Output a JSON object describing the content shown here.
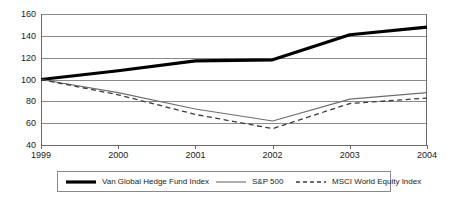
{
  "chart_data": {
    "type": "line",
    "title": "",
    "subtitle": "",
    "xlabel": "",
    "ylabel": "",
    "x": [
      "1999",
      "2000",
      "2001",
      "2002",
      "2003",
      "2004"
    ],
    "categories": [
      "1999",
      "2000",
      "2001",
      "2002",
      "2003",
      "2004"
    ],
    "xlim": [
      1999,
      2004
    ],
    "ylim": [
      40,
      160
    ],
    "y_ticks": [
      40,
      60,
      80,
      100,
      120,
      140,
      160
    ],
    "x_ticks": [
      "1999",
      "2000",
      "2001",
      "2002",
      "2003",
      "2004"
    ],
    "grid": "horizontal",
    "legend_position": "bottom",
    "series": [
      {
        "name": "Van Global Hedge Fund Index",
        "values": [
          100,
          108,
          117,
          118,
          141,
          148
        ],
        "style": "solid-thick",
        "color": "#000000",
        "width": 3.2
      },
      {
        "name": "S&P 500",
        "values": [
          100,
          88,
          73,
          62,
          82,
          88
        ],
        "style": "solid-thin",
        "color": "#6e6e6e",
        "width": 1.1
      },
      {
        "name": "MSCI World Equity Index",
        "values": [
          100,
          86,
          68,
          55,
          78,
          83
        ],
        "style": "dashed",
        "color": "#3a3a3a",
        "width": 1.3
      }
    ]
  },
  "axes": {
    "y_labels": [
      "160",
      "140",
      "120",
      "100",
      "80",
      "60",
      "40"
    ],
    "x_labels": [
      "1999",
      "2000",
      "2001",
      "2002",
      "2003",
      "2004"
    ]
  },
  "legend": {
    "items": [
      {
        "label": "Van Global Hedge Fund Index",
        "swatch": "thick-solid-line-icon"
      },
      {
        "label": "S&P 500",
        "swatch": "thin-solid-line-icon"
      },
      {
        "label": "MSCI World Equity Index",
        "swatch": "dashed-line-icon"
      }
    ]
  },
  "colors": {
    "grid": "#8a8a8a",
    "axis": "#6a6a6a",
    "series_primary": "#000000",
    "series_secondary": "#6e6e6e",
    "series_tertiary": "#3a3a3a",
    "background": "#ffffff"
  }
}
